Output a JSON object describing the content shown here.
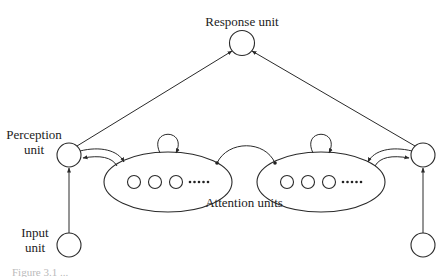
{
  "diagram": {
    "nodes": {
      "response": {
        "label": "Response unit"
      },
      "perception_left": {
        "label_line1": "Perception",
        "label_line2": "unit"
      },
      "perception_right": {
        "label": ""
      },
      "input_left": {
        "label_line1": "Input",
        "label_line2": "unit"
      },
      "input_right": {
        "label": ""
      },
      "attention_groups": {
        "label": "Attention units",
        "group_count": 2,
        "units_per_group_shown": 3,
        "ellipsis": "•••••"
      }
    },
    "edges": [
      {
        "from": "input_left",
        "to": "perception_left"
      },
      {
        "from": "input_right",
        "to": "perception_right"
      },
      {
        "from": "perception_left",
        "to": "response"
      },
      {
        "from": "perception_right",
        "to": "response"
      },
      {
        "from": "perception_left",
        "to": "attention_left",
        "bidirectional": true
      },
      {
        "from": "perception_right",
        "to": "attention_right",
        "bidirectional": true
      },
      {
        "from": "attention_left",
        "to": "attention_left",
        "type": "self-loop"
      },
      {
        "from": "attention_right",
        "to": "attention_right",
        "type": "self-loop"
      },
      {
        "from": "attention_left",
        "to": "attention_right",
        "type": "inhibitory-link"
      }
    ],
    "caption": "Figure 3.1 ..."
  }
}
